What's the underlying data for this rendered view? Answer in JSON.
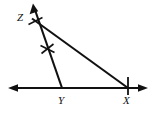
{
  "figure": {
    "background_color": "#ffffff",
    "stroke_color": "#111111",
    "width": 153,
    "height": 116,
    "labels": {
      "z": "Z",
      "y": "Y",
      "x": "X"
    },
    "points": {
      "Z": {
        "x": 31,
        "y": 22
      },
      "Y": {
        "x": 62,
        "y": 88
      },
      "X": {
        "x": 128,
        "y": 88
      }
    },
    "baseline": {
      "name": "horizontal-line",
      "y": 88,
      "x_start": 8,
      "x_end": 148,
      "arrow_left": true,
      "arrow_right": true
    },
    "rays": [
      {
        "name": "ray-Y-through-Z",
        "from": {
          "x": 62,
          "y": 88
        },
        "to": {
          "x": 33,
          "y": 4
        },
        "arrow_at_end": true
      },
      {
        "name": "segment-Z-to-X",
        "from": {
          "x": 33,
          "y": 20
        },
        "to": {
          "x": 128,
          "y": 88
        },
        "arrow_at_end": false
      }
    ],
    "tick_marks": [
      {
        "name": "single-tick-near-Z",
        "x": 34,
        "y": 21,
        "style": "single-slash"
      },
      {
        "name": "double-tick-on-ray",
        "x": 47,
        "y": 49,
        "style": "double-slash"
      },
      {
        "name": "tick-at-X",
        "x": 128,
        "y": 88,
        "style": "vertical"
      }
    ]
  }
}
